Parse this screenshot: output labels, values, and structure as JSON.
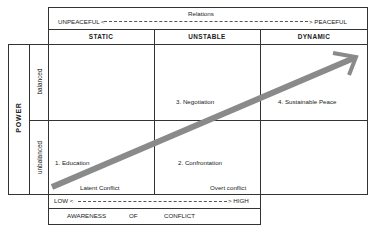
{
  "relations": {
    "title": "Relations",
    "left_label": "UNPEACEFUL <",
    "right_label": "> PEACEFUL"
  },
  "columns": [
    {
      "label": "STATIC"
    },
    {
      "label": "UNSTABLE"
    },
    {
      "label": "DYNAMIC"
    }
  ],
  "power": {
    "title": "POWER",
    "rows": [
      {
        "label": "balanced"
      },
      {
        "label": "unbalanced"
      }
    ]
  },
  "cells": {
    "education": "1.  Education",
    "confrontation": "2.  Confrontation",
    "negotiation": "3.  Negotiation",
    "sustainable_peace": "4.  Sustainable Peace",
    "latent_conflict": "Latent Conflict",
    "overt_conflict": "Overt conflict"
  },
  "awareness": {
    "low_label": "LOW <",
    "high_label": "> HIGH",
    "words": [
      "AWARENESS",
      "OF",
      "CONFLICT"
    ]
  },
  "colors": {
    "lines": "#333333",
    "arrow": "#8a8a8a",
    "background": "#ffffff"
  }
}
